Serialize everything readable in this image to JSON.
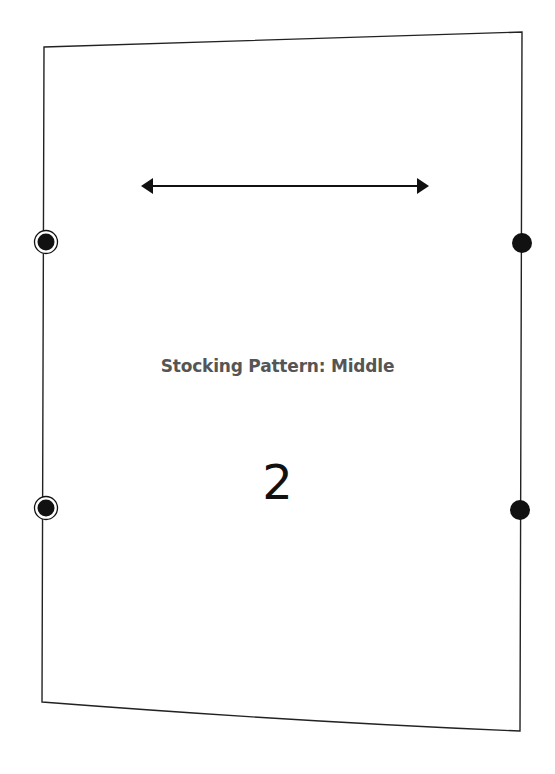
{
  "pattern": {
    "title": "Stocking Pattern: Middle",
    "piece_number": "2",
    "outline_color": "#222222",
    "outline": {
      "top_left": [
        44,
        47
      ],
      "top_right": [
        522,
        32
      ],
      "bottom_right": [
        520,
        731
      ],
      "bottom_left": [
        42,
        702
      ]
    },
    "grainline": {
      "icon": "double-arrow-icon",
      "x1": 142,
      "x2": 428,
      "y": 186
    },
    "notches": [
      {
        "side": "left",
        "x": 46,
        "y": 242,
        "style": "ringed-dot"
      },
      {
        "side": "left",
        "x": 46,
        "y": 508,
        "style": "ringed-dot"
      },
      {
        "side": "right",
        "x": 522,
        "y": 243,
        "style": "dot"
      },
      {
        "side": "right",
        "x": 520,
        "y": 510,
        "style": "dot"
      }
    ]
  }
}
